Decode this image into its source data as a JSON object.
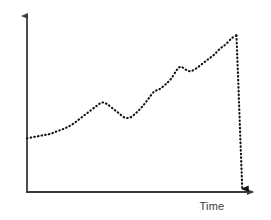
{
  "chart_data": {
    "type": "line",
    "title": "",
    "subtitle": "",
    "xlabel": "Time",
    "ylabel": "Trust",
    "grid": false,
    "legend": null,
    "axis_style": "arrow-headed open axes, no tick marks, no tick labels",
    "line_style": "dotted",
    "line_color": "#111111",
    "axis_color": "#3b3b3b",
    "background_color": "#ffffff",
    "annotations": [
      {
        "name": "trust-collapse-arrow",
        "description": "Arrowhead at the end of the steep final drop, pointing down toward the Time axis"
      }
    ],
    "series": [
      {
        "name": "Trust over time",
        "x": [
          0,
          8,
          16,
          24,
          32,
          40,
          48,
          56,
          64,
          72,
          77,
          82,
          88,
          94,
          100,
          106,
          112,
          118,
          124,
          130,
          136,
          142,
          148,
          154,
          158,
          163,
          168,
          174,
          180,
          186,
          192,
          198,
          204,
          210,
          215,
          217,
          219,
          221
        ],
        "y": [
          36,
          37,
          38,
          39,
          41,
          43,
          46,
          50,
          54,
          58,
          60,
          59,
          56,
          53,
          50,
          50,
          53,
          57,
          62,
          67,
          69,
          72,
          76,
          82,
          84,
          82,
          81,
          83,
          86,
          89,
          92,
          96,
          99,
          103,
          105,
          72,
          36,
          2
        ],
        "y_description": "Relative trust level, arbitrary units (axis unlabeled); rises gradually with two humps, peaks near the right edge, then collapses almost vertically to near zero"
      }
    ],
    "xlim": [
      0,
      232
    ],
    "ylim": [
      0,
      118
    ],
    "shape_notes": "Conceptual diagram: trust builds slowly over time with minor setbacks, reaches a maximum, then drops abruptly"
  },
  "labels": {
    "y_axis": "Trust",
    "x_axis": "Time"
  }
}
